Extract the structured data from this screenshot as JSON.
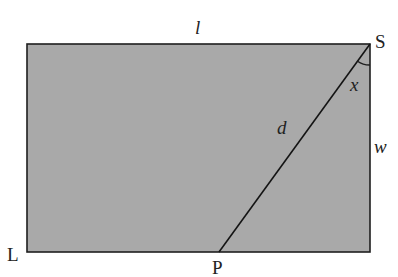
{
  "diagram": {
    "type": "geometry-rectangle-with-diagonal",
    "shape": "rectangle",
    "fill_color": "#a9a9a9",
    "stroke_color": "#1e1e1e",
    "vertices": {
      "top_left": {
        "x": 27,
        "y": 44
      },
      "top_right_S": {
        "x": 370,
        "y": 44
      },
      "bottom_right": {
        "x": 370,
        "y": 252
      },
      "bottom_left_L": {
        "x": 27,
        "y": 252
      },
      "point_P": {
        "x": 219,
        "y": 252
      }
    },
    "segment": {
      "from": "S",
      "to": "P",
      "label": "d"
    },
    "angle": {
      "at": "S",
      "between": [
        "SP",
        "right side"
      ],
      "label": "x"
    },
    "labels": {
      "top_side": "l",
      "right_side": "w",
      "diagonal": "d",
      "angle": "x",
      "point_S": "S",
      "point_L": "L",
      "point_P": "P"
    }
  }
}
